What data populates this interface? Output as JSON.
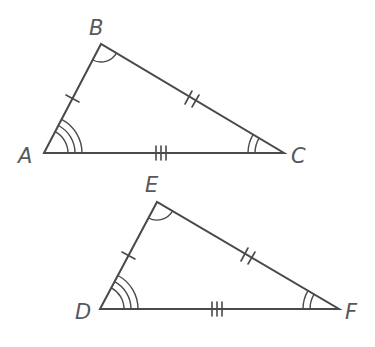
{
  "diagram": {
    "stroke_color": "#4a4a4c",
    "label_color": "#58585a",
    "triangles": [
      {
        "name": "ABC",
        "vertices": {
          "A": {
            "label": "A",
            "x": 44,
            "y": 153
          },
          "B": {
            "label": "B",
            "x": 101,
            "y": 44
          },
          "C": {
            "label": "C",
            "x": 284,
            "y": 153
          }
        },
        "side_marks": {
          "AB": 1,
          "BC": 2,
          "AC": 3
        },
        "angle_marks": {
          "A": 3,
          "B": 1,
          "C": 2
        }
      },
      {
        "name": "DEF",
        "vertices": {
          "D": {
            "label": "D",
            "x": 100,
            "y": 309
          },
          "E": {
            "label": "E",
            "x": 157,
            "y": 202
          },
          "F": {
            "label": "F",
            "x": 339,
            "y": 309
          }
        },
        "side_marks": {
          "DE": 1,
          "EF": 2,
          "DF": 3
        },
        "angle_marks": {
          "D": 3,
          "E": 1,
          "F": 2
        }
      }
    ],
    "labels": {
      "A": "A",
      "B": "B",
      "C": "C",
      "D": "D",
      "E": "E",
      "F": "F"
    }
  }
}
